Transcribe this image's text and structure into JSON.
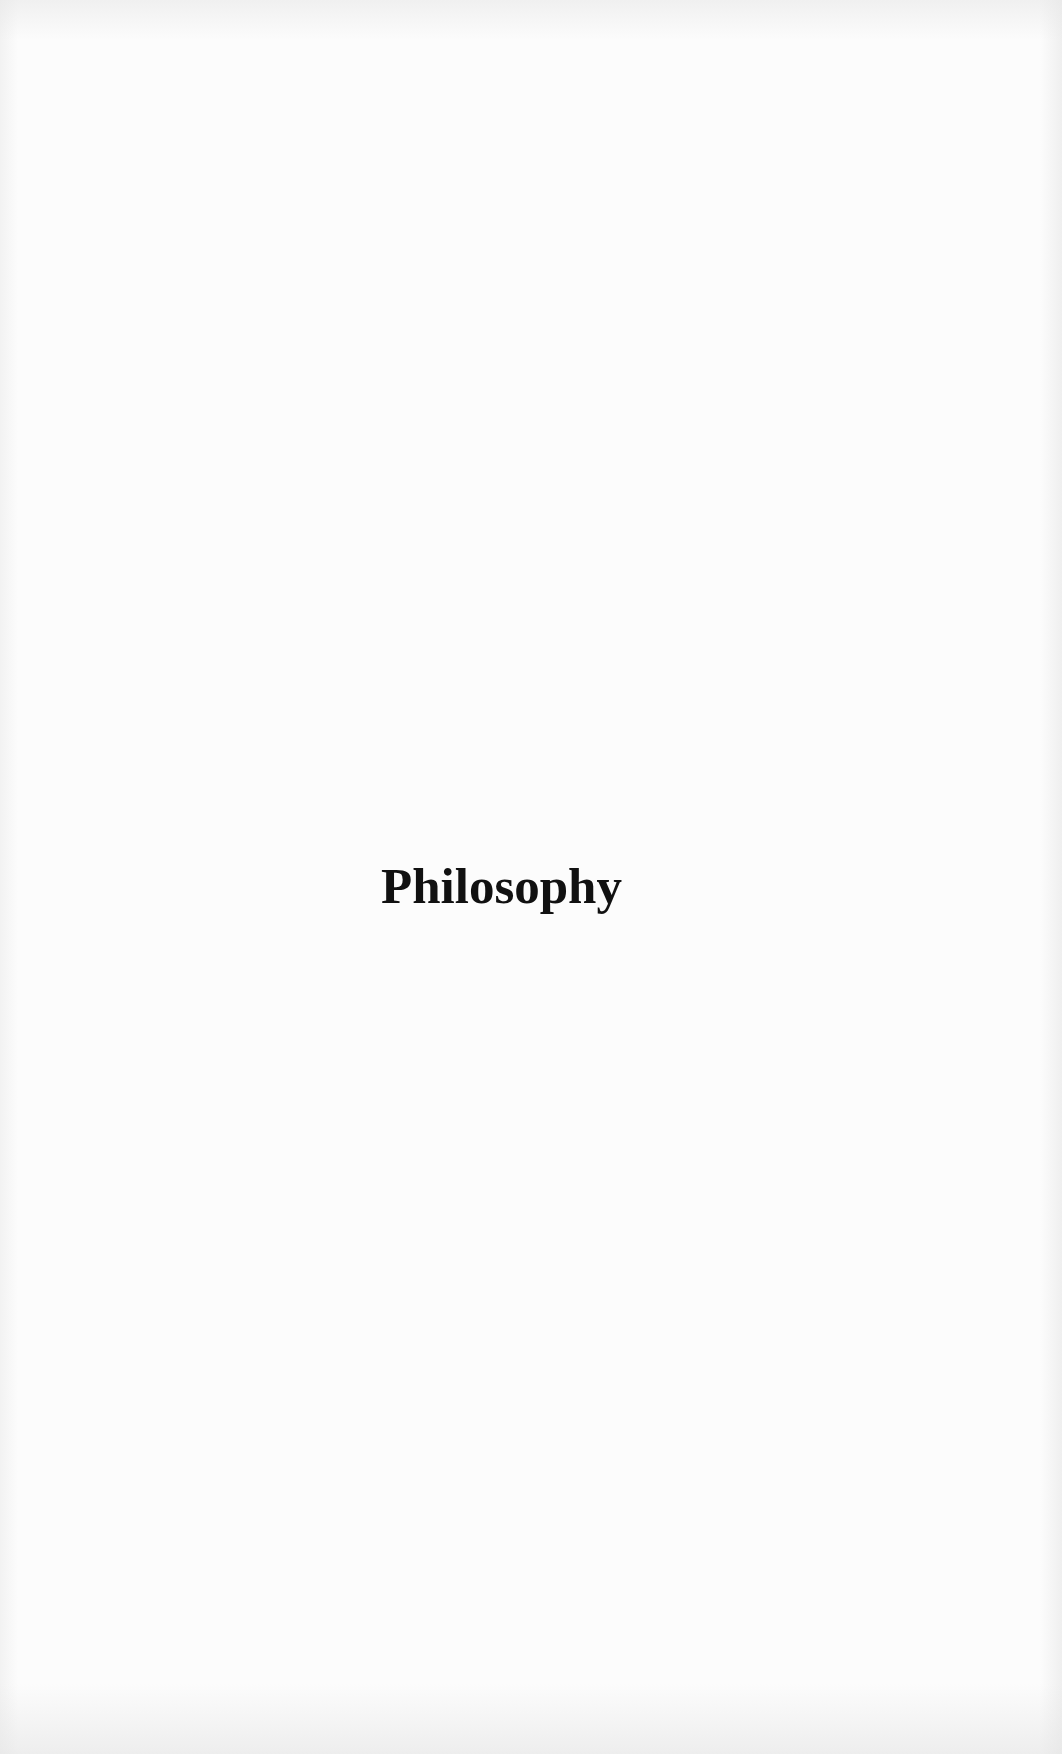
{
  "page": {
    "title": "Philosophy",
    "background_color": "#fcfcfc",
    "text_color": "#111111"
  }
}
